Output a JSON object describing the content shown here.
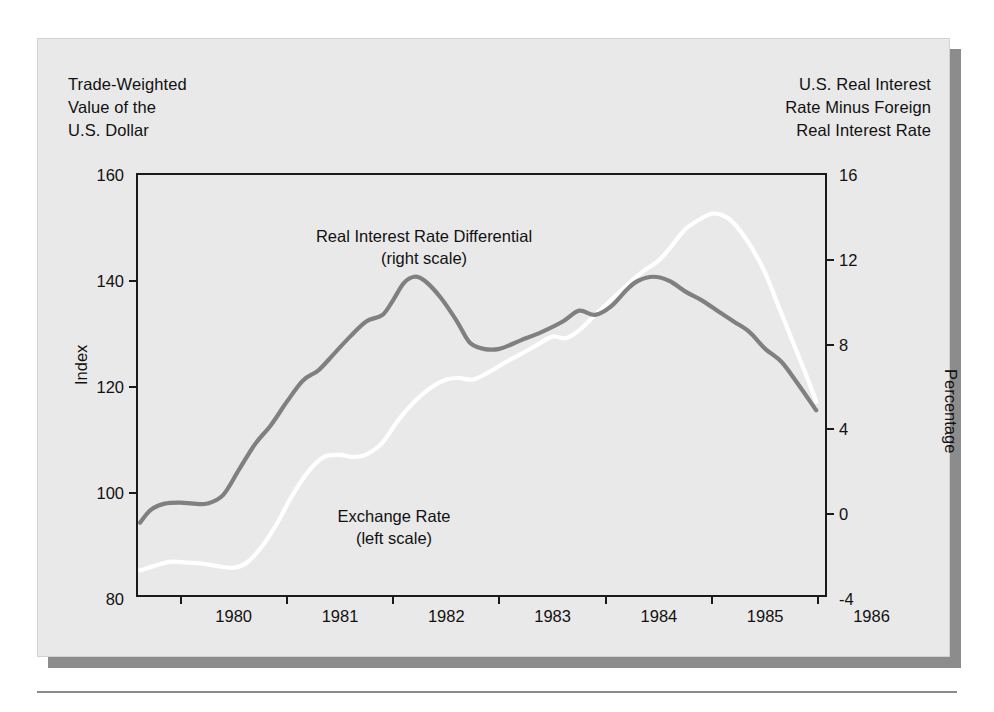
{
  "figure": {
    "caption_left": "Trade-Weighted\nValue of the\nU.S. Dollar",
    "caption_right": "U.S. Real Interest\nRate Minus Foreign\nReal Interest Rate",
    "left_axis_title": "Index",
    "right_axis_title": "Percentage",
    "note_differential": "Real Interest Rate Differential\n(right scale)",
    "note_exchange": "Exchange Rate\n(left scale)",
    "colors": {
      "panel_background": "#e9e9e9",
      "panel_shadow": "#8c8c8c",
      "page_background": "#ffffff",
      "axis": "#1a1a1a",
      "exchange_rate_line": "#ffffff",
      "differential_line": "#808080",
      "text": "#111111"
    }
  },
  "chart_data": {
    "type": "line",
    "xlabel": "",
    "ylabel": "Index",
    "y2label": "Percentage",
    "grid": false,
    "legend": "inline-annotations",
    "xlim": [
      1979.6,
      1986.1
    ],
    "xticks": [
      1980,
      1981,
      1982,
      1983,
      1984,
      1985,
      1986
    ],
    "xticklabels": [
      "1980",
      "1981",
      "1982",
      "1983",
      "1984",
      "1985",
      "1986"
    ],
    "xtick_label_offset_years": 0.5,
    "ylim": [
      80,
      160
    ],
    "yticks": [
      80,
      100,
      120,
      140,
      160
    ],
    "yticklabels": [
      "80",
      "100",
      "120",
      "140",
      "160"
    ],
    "y2lim": [
      -4,
      16
    ],
    "y2ticks": [
      -4,
      0,
      4,
      8,
      12,
      16
    ],
    "y2ticklabels": [
      "-4",
      "0",
      "4",
      "8",
      "12",
      "16"
    ],
    "series": [
      {
        "name": "Exchange Rate",
        "scale": "left",
        "axis_label": "(left scale)",
        "color": "#ffffff",
        "x": [
          1979.62,
          1979.75,
          1979.9,
          1980.05,
          1980.2,
          1980.35,
          1980.5,
          1980.62,
          1980.75,
          1980.9,
          1981.05,
          1981.2,
          1981.35,
          1981.5,
          1981.62,
          1981.75,
          1981.9,
          1982.05,
          1982.2,
          1982.35,
          1982.5,
          1982.62,
          1982.75,
          1982.9,
          1983.05,
          1983.2,
          1983.35,
          1983.5,
          1983.62,
          1983.75,
          1983.9,
          1984.05,
          1984.2,
          1984.35,
          1984.5,
          1984.62,
          1984.75,
          1984.9,
          1985.0,
          1985.1,
          1985.2,
          1985.35,
          1985.5,
          1985.62,
          1985.75,
          1985.9,
          1985.98
        ],
        "y": [
          85.4,
          86.2,
          87.0,
          86.9,
          86.7,
          86.2,
          85.9,
          86.8,
          89.5,
          94.0,
          99.5,
          104.0,
          106.8,
          107.2,
          106.8,
          107.3,
          109.5,
          113.8,
          117.2,
          119.8,
          121.4,
          121.7,
          121.4,
          122.8,
          124.6,
          126.2,
          127.9,
          129.5,
          129.2,
          130.7,
          133.6,
          136.4,
          139.2,
          141.8,
          143.9,
          146.6,
          149.8,
          151.8,
          152.7,
          152.4,
          151.0,
          147.0,
          141.5,
          135.5,
          129.0,
          121.5,
          117.2
        ]
      },
      {
        "name": "Real Interest Rate Differential",
        "scale": "right",
        "axis_label": "(right scale)",
        "color": "#808080",
        "x": [
          1979.62,
          1979.72,
          1979.85,
          1980.0,
          1980.12,
          1980.25,
          1980.4,
          1980.55,
          1980.7,
          1980.85,
          1981.0,
          1981.15,
          1981.3,
          1981.45,
          1981.6,
          1981.75,
          1981.9,
          1982.0,
          1982.1,
          1982.2,
          1982.3,
          1982.45,
          1982.6,
          1982.72,
          1982.85,
          1983.0,
          1983.2,
          1983.4,
          1983.6,
          1983.75,
          1983.9,
          1984.05,
          1984.2,
          1984.3,
          1984.45,
          1984.6,
          1984.75,
          1984.9,
          1985.05,
          1985.2,
          1985.35,
          1985.5,
          1985.65,
          1985.8,
          1985.98
        ],
        "y": [
          -0.4,
          0.2,
          0.5,
          0.55,
          0.5,
          0.5,
          0.9,
          2.1,
          3.3,
          4.2,
          5.3,
          6.3,
          6.8,
          7.6,
          8.4,
          9.1,
          9.4,
          10.1,
          10.9,
          11.2,
          11.0,
          10.2,
          9.1,
          8.1,
          7.8,
          7.8,
          8.2,
          8.6,
          9.1,
          9.6,
          9.4,
          9.8,
          10.6,
          11.0,
          11.2,
          11.0,
          10.5,
          10.1,
          9.6,
          9.1,
          8.6,
          7.8,
          7.2,
          6.2,
          4.9
        ]
      }
    ]
  }
}
